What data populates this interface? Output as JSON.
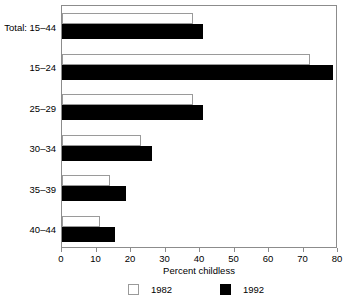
{
  "chart_data": {
    "type": "bar",
    "orientation": "horizontal",
    "title": "",
    "xlabel": "Percent childless",
    "ylabel": "",
    "xlim": [
      0,
      80
    ],
    "xticks": [
      0,
      10,
      20,
      30,
      40,
      50,
      60,
      70,
      80
    ],
    "grid": false,
    "legend_position": "bottom",
    "categories": [
      "Total: 15–44",
      "15–24",
      "25–29",
      "30–34",
      "35–39",
      "40–44"
    ],
    "series": [
      {
        "name": "1982",
        "color": "#ffffff",
        "edge_color": "#9a9a9a",
        "values": [
          38,
          72,
          38,
          23,
          14,
          11
        ]
      },
      {
        "name": "1992",
        "color": "#000000",
        "edge_color": "#000000",
        "values": [
          41,
          78.5,
          41,
          26,
          18.5,
          15.5
        ]
      }
    ]
  },
  "legend": {
    "entries": [
      {
        "label": "1982",
        "swatch": "open-square-icon"
      },
      {
        "label": "1992",
        "swatch": "filled-square-icon"
      }
    ]
  }
}
